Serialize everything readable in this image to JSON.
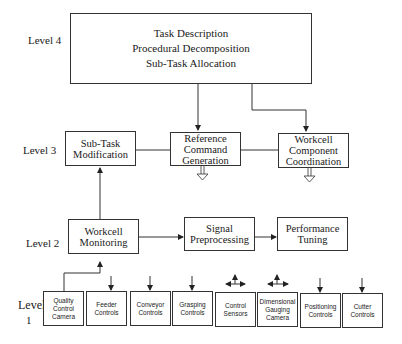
{
  "levels": {
    "level4": "Level 4",
    "level3": "Level 3",
    "level2": "Level 2",
    "level1_a": "Level",
    "level1_b": "1"
  },
  "level4_box": {
    "lines": [
      "Task Description",
      "Procedural Decomposition",
      "Sub-Task Allocation"
    ]
  },
  "level3_boxes": [
    {
      "lines": [
        "Sub-Task",
        "Modification"
      ]
    },
    {
      "lines": [
        "Reference",
        "Command",
        "Generation"
      ]
    },
    {
      "lines": [
        "Workcell",
        "Component",
        "Coordination"
      ]
    }
  ],
  "level2_boxes": [
    {
      "lines": [
        "Workcell",
        "Monitoring"
      ]
    },
    {
      "lines": [
        "Signal",
        "Preprocessing"
      ]
    },
    {
      "lines": [
        "Performance",
        "Tuning"
      ]
    }
  ],
  "level1_boxes": [
    {
      "lines": [
        "Quality",
        "Control",
        "Camera"
      ]
    },
    {
      "lines": [
        "Feeder",
        "Controls"
      ]
    },
    {
      "lines": [
        "Conveyor",
        "Controls"
      ]
    },
    {
      "lines": [
        "Grasping",
        "Controls"
      ]
    },
    {
      "lines": [
        "Control",
        "Sensors"
      ]
    },
    {
      "lines": [
        "Dimensional",
        "Gauging",
        "Camera"
      ]
    },
    {
      "lines": [
        "Positioning",
        "Controls"
      ]
    },
    {
      "lines": [
        "Cutter",
        "Controls"
      ]
    }
  ]
}
